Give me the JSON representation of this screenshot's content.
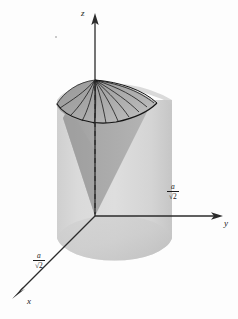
{
  "figure": {
    "background_color": "#fdfdfd",
    "axes": {
      "z_label": "z",
      "y_label": "y",
      "x_label": "x",
      "axis_color": "#2b2b2b",
      "origin": {
        "x": 95,
        "y": 216
      },
      "z_tip": {
        "x": 95,
        "y": 14
      },
      "y_tip": {
        "x": 223,
        "y": 216
      },
      "x_tip": {
        "x": 12,
        "y": 297
      }
    },
    "annotations": [
      {
        "name": "y-axis-radius-label",
        "numerator": "a",
        "bar": "",
        "denominator": "√2",
        "position": {
          "left": 167,
          "top": 183
        }
      },
      {
        "name": "x-axis-radius-label",
        "numerator": "a",
        "bar": "",
        "denominator": "√2",
        "position": {
          "left": 33,
          "top": 252
        }
      }
    ],
    "solids": {
      "cylinder": {
        "name": "cylinder",
        "fill_color": "#d6d6d6",
        "fill_color_dark": "#c9c9c9",
        "top_y": 96,
        "bottom_y": 262,
        "left_x": 57,
        "right_x": 172
      },
      "cone": {
        "name": "cone",
        "fill_color": "#a9a9a9",
        "fill_color_light": "#b8b8b8",
        "apex": {
          "x": 95,
          "y": 80
        },
        "base_center": {
          "x": 95,
          "y": 216
        },
        "meridian_count": 12,
        "meridian_color": "#111111"
      },
      "axis_dashes": {
        "name": "cone-axis-dashed-line",
        "color": "#1a1a1a",
        "from": {
          "x": 95,
          "y": 86
        },
        "to": {
          "x": 95,
          "y": 214
        }
      }
    },
    "speck": {
      "left": 55,
      "top": 36
    }
  }
}
